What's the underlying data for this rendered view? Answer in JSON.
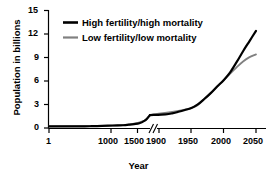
{
  "chart_data": {
    "type": "line",
    "title": "",
    "xlabel": "Year",
    "ylabel": "Population in billions",
    "xtick_labels": [
      "1",
      "1000",
      "1500",
      "1900",
      "1950",
      "2000",
      "2050"
    ],
    "ytick_labels": [
      "0",
      "3",
      "6",
      "9",
      "12",
      "15"
    ],
    "ylim": [
      0,
      15
    ],
    "grid": false,
    "axis_break": {
      "present": true,
      "glyph": "//",
      "between": [
        "1900",
        "1900"
      ],
      "note": "x-axis scale changes after 1900"
    },
    "legend": {
      "position": "top-left-inside",
      "entries": [
        {
          "label": "High fertility/high mortality",
          "color": "#000000"
        },
        {
          "label": "Low fertility/low mortality",
          "color": "#808080"
        }
      ]
    },
    "series": [
      {
        "name": "High fertility/high mortality",
        "color": "#000000",
        "points": [
          {
            "year": 1,
            "value": 0.2
          },
          {
            "year": 200,
            "value": 0.2
          },
          {
            "year": 400,
            "value": 0.2
          },
          {
            "year": 600,
            "value": 0.2
          },
          {
            "year": 800,
            "value": 0.23
          },
          {
            "year": 1000,
            "value": 0.27
          },
          {
            "year": 1200,
            "value": 0.32
          },
          {
            "year": 1400,
            "value": 0.35
          },
          {
            "year": 1500,
            "value": 0.42
          },
          {
            "year": 1600,
            "value": 0.5
          },
          {
            "year": 1700,
            "value": 0.6
          },
          {
            "year": 1800,
            "value": 0.95
          },
          {
            "year": 1850,
            "value": 1.25
          },
          {
            "year": 1900,
            "value": 1.65
          },
          {
            "year": 1910,
            "value": 1.75
          },
          {
            "year": 1920,
            "value": 1.86
          },
          {
            "year": 1930,
            "value": 2.07
          },
          {
            "year": 1940,
            "value": 2.3
          },
          {
            "year": 1950,
            "value": 2.55
          },
          {
            "year": 1960,
            "value": 3.02
          },
          {
            "year": 1970,
            "value": 3.7
          },
          {
            "year": 1980,
            "value": 4.45
          },
          {
            "year": 1990,
            "value": 5.3
          },
          {
            "year": 2000,
            "value": 6.1
          },
          {
            "year": 2010,
            "value": 7.1
          },
          {
            "year": 2020,
            "value": 8.4
          },
          {
            "year": 2030,
            "value": 9.8
          },
          {
            "year": 2040,
            "value": 11.1
          },
          {
            "year": 2050,
            "value": 12.4
          }
        ]
      },
      {
        "name": "Low fertility/low mortality",
        "color": "#808080",
        "points": [
          {
            "year": 1,
            "value": 0.2
          },
          {
            "year": 1000,
            "value": 0.27
          },
          {
            "year": 1500,
            "value": 0.42
          },
          {
            "year": 1800,
            "value": 0.95
          },
          {
            "year": 1900,
            "value": 1.65
          },
          {
            "year": 1950,
            "value": 2.55
          },
          {
            "year": 1970,
            "value": 3.7
          },
          {
            "year": 1980,
            "value": 4.45
          },
          {
            "year": 1990,
            "value": 5.3
          },
          {
            "year": 2000,
            "value": 6.1
          },
          {
            "year": 2010,
            "value": 6.95
          },
          {
            "year": 2020,
            "value": 7.75
          },
          {
            "year": 2030,
            "value": 8.5
          },
          {
            "year": 2040,
            "value": 9.05
          },
          {
            "year": 2050,
            "value": 9.4
          }
        ]
      }
    ]
  }
}
